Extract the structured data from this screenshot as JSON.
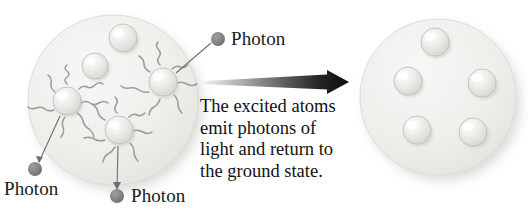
{
  "figure": {
    "caption_lines": [
      "The excited atoms",
      "emit photons of",
      "light and return to",
      "the ground state."
    ],
    "caption_full": "The excited atoms emit photons of light and return to the ground state."
  },
  "labels": {
    "photon_top": "Photon",
    "photon_bottom_left": "Photon",
    "photon_bottom_center": "Photon"
  },
  "colors": {
    "photon_dot": "#808080",
    "medium_fill": "#ededea",
    "medium_edge": "#d8d8d4",
    "atom_fill": "#e3e3e0",
    "atom_highlight": "#fbfbfb",
    "atom_edge": "#b8b8b4",
    "squiggle": "#9a9a98",
    "leader_line": "#6e6e6e",
    "arrow_dark": "#111111",
    "text": "#1a1a1a",
    "shadow": "#b4b4b0",
    "background": "#ffffff"
  },
  "left_medium": {
    "name": "excited-medium",
    "cx": 113,
    "cy": 100,
    "r": 85,
    "ground_atoms": [
      {
        "cx": 123,
        "cy": 38,
        "r": 14
      },
      {
        "cx": 95,
        "cy": 66,
        "r": 13
      }
    ],
    "excited_atoms": [
      {
        "cx": 67,
        "cy": 101,
        "r": 14,
        "squiggles": 7
      },
      {
        "cx": 163,
        "cy": 82,
        "r": 14,
        "squiggles": 7
      },
      {
        "cx": 119,
        "cy": 130,
        "r": 14,
        "squiggles": 7
      }
    ]
  },
  "right_medium": {
    "name": "ground-state-medium",
    "cx": 438,
    "cy": 97,
    "r": 78,
    "ground_atoms": [
      {
        "cx": 435,
        "cy": 42,
        "r": 14
      },
      {
        "cx": 408,
        "cy": 81,
        "r": 14
      },
      {
        "cx": 482,
        "cy": 83,
        "r": 14
      },
      {
        "cx": 417,
        "cy": 130,
        "r": 14
      },
      {
        "cx": 473,
        "cy": 132,
        "r": 14
      }
    ]
  },
  "photons": [
    {
      "id": "photon-top",
      "dot_cx": 218,
      "dot_cy": 39,
      "dot_r": 7,
      "label_x": 231,
      "label_y": 29,
      "leader": {
        "x1": 176,
        "y1": 73,
        "x2": 211,
        "y2": 43
      }
    },
    {
      "id": "photon-bottom-left",
      "dot_cx": 35,
      "dot_cy": 169,
      "dot_r": 7,
      "label_x": 5,
      "label_y": 180,
      "leader": {
        "x1": 60,
        "y1": 116,
        "x2": 39,
        "y2": 162
      }
    },
    {
      "id": "photon-bottom-center",
      "dot_cx": 117,
      "dot_cy": 196,
      "dot_r": 7,
      "label_x": 131,
      "label_y": 186,
      "leader": {
        "x1": 118,
        "y1": 146,
        "x2": 117,
        "y2": 188
      }
    }
  ],
  "arrow": {
    "x_start": 201,
    "x_end": 349,
    "y": 82,
    "tail_thickness": 3,
    "head_thickness": 16,
    "head_length": 22,
    "gradient_from": "#f2f2f2",
    "gradient_to": "#0d0d0d"
  }
}
